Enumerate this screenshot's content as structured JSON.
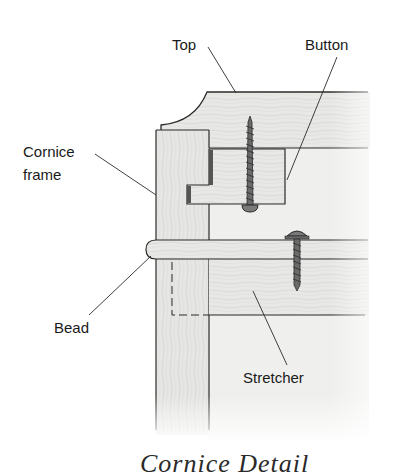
{
  "diagram": {
    "caption": "Cornice Detail",
    "labels": {
      "top": "Top",
      "button": "Button",
      "cornice_frame_line1": "Cornice",
      "cornice_frame_line2": "frame",
      "bead": "Bead",
      "stretcher": "Stretcher"
    },
    "parts": [
      "top",
      "button",
      "cornice-frame",
      "bead",
      "stretcher",
      "screw",
      "screw"
    ],
    "colors": {
      "line": "#2b2b2b",
      "wood_fill": "#e6e6e4",
      "wood_fill_light": "#efefed",
      "background": "#ffffff"
    }
  }
}
